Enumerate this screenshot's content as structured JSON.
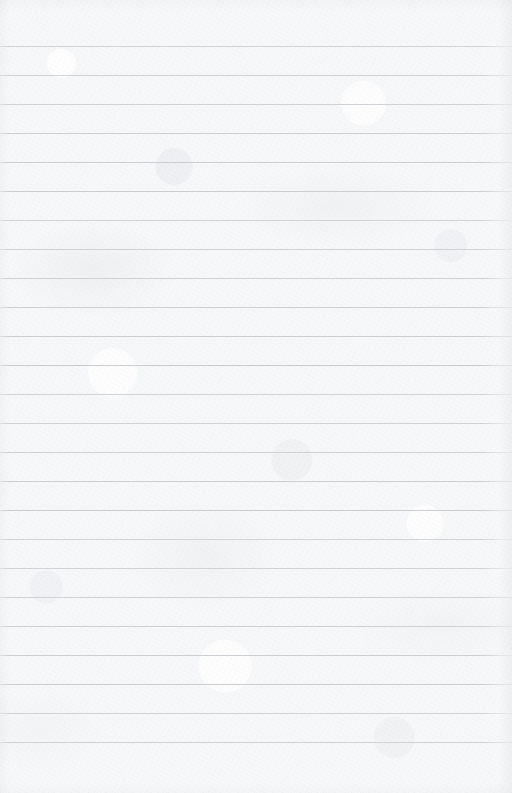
{
  "document": {
    "kind": "ruled-notebook-paper",
    "title": "Blank ruled paper sheet",
    "content_text": "",
    "page_number_text": "",
    "header_text": "",
    "footer_text": "",
    "annotations": [],
    "width_px": 512,
    "height_px": 793
  },
  "paper": {
    "background_color": "#f7f8f9",
    "texture": "mottled-fibrous-scan",
    "sheet_edge_shading": true
  },
  "ruling": {
    "line_color": "#c9ccd1",
    "line_thickness_px": 1,
    "line_spacing_px": 29,
    "first_line_y_px": 46,
    "last_line_y_px": 742,
    "line_count": 25,
    "full_bleed": true,
    "margin_rule_vertical": false,
    "line_y_positions": [
      46,
      75,
      104,
      133,
      162,
      191,
      220,
      249,
      278,
      307,
      336,
      365,
      394,
      423,
      452,
      481,
      510,
      539,
      568,
      597,
      626,
      655,
      684,
      713,
      742
    ],
    "line_x_start_px": 0,
    "line_x_end_px": 512
  },
  "margins": {
    "top_margin_height_px": 46,
    "bottom_margin_height_px": 51,
    "left_margin_width_px": 0,
    "right_margin_width_px": 0
  }
}
